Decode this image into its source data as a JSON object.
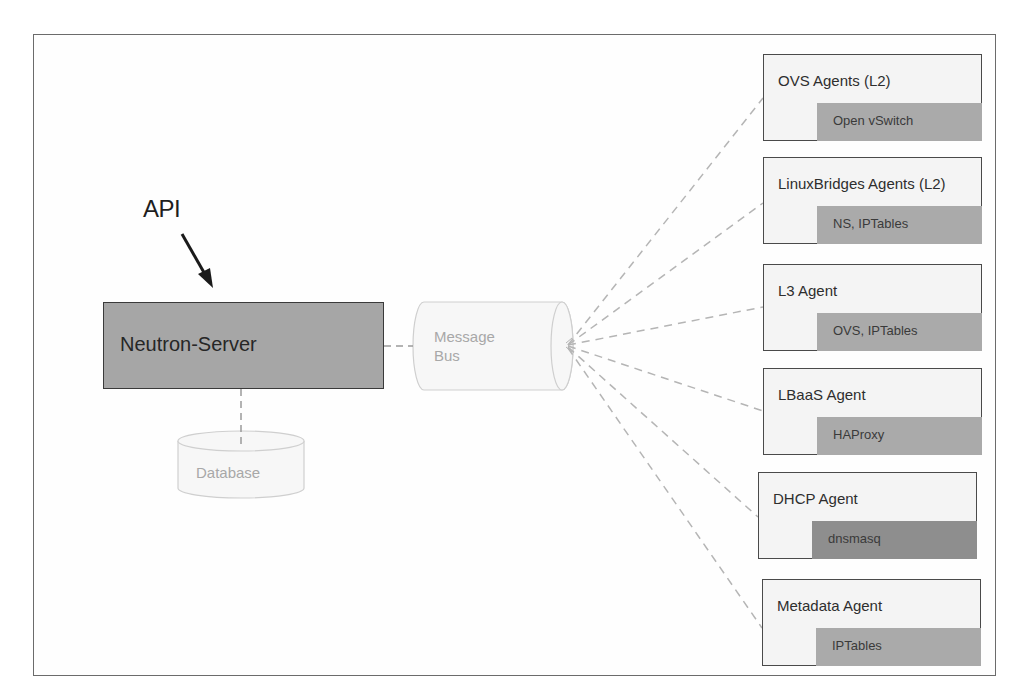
{
  "diagram": {
    "api_label": "API",
    "server": {
      "label": "Neutron-Server",
      "fill": "#a6a6a6"
    },
    "message_bus": {
      "label_line1": "Message",
      "label_line2": "Bus"
    },
    "database": {
      "label": "Database"
    },
    "agents": [
      {
        "title": "OVS Agents (L2)",
        "inner": "Open vSwitch"
      },
      {
        "title": "LinuxBridges Agents (L2)",
        "inner": "NS, IPTables"
      },
      {
        "title": "L3 Agent",
        "inner": "OVS, IPTables"
      },
      {
        "title": "LBaaS Agent",
        "inner": "HAProxy"
      },
      {
        "title": "DHCP Agent",
        "inner": "dnsmasq"
      },
      {
        "title": "Metadata Agent",
        "inner": "IPTables"
      }
    ],
    "colors": {
      "frame": "#6b6b6b",
      "agent_inner": "#aaaaaa",
      "agent_inner_dark": "#8e8e8e",
      "dashed_line": "#b5b5b5"
    }
  }
}
